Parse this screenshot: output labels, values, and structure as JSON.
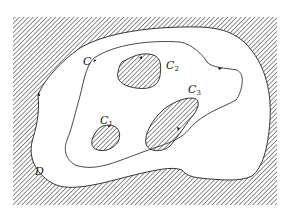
{
  "figure": {
    "colors": {
      "stroke": "#333333",
      "hatch": "#555555",
      "background": "#ffffff"
    }
  },
  "labels": {
    "outer_contour": {
      "base": "C",
      "sub": ""
    },
    "contour_1": {
      "base": "C",
      "sub": "1"
    },
    "contour_2": {
      "base": "C",
      "sub": "2"
    },
    "contour_3": {
      "base": "C",
      "sub": "3"
    },
    "region": {
      "base": "D"
    }
  }
}
